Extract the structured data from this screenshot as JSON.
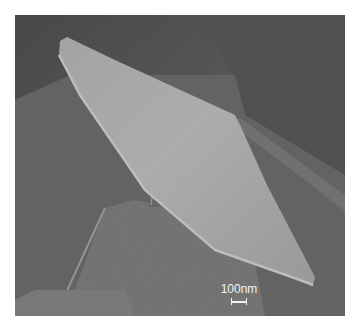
{
  "image": {
    "type": "SEM micrograph",
    "description": "Tilted nanoscale plate supported on a narrow pillar above stepped substrate structures",
    "scale_bar": {
      "label": "100nm"
    }
  }
}
